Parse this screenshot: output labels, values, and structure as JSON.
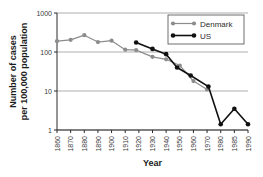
{
  "chart_data": {
    "type": "line",
    "title": "",
    "xlabel": "Year",
    "ylabel_line1": "Number of cases",
    "ylabel_line2": "per 100,000 population",
    "yscale": "log",
    "ylim": [
      1,
      1000
    ],
    "ytick_labels": [
      "1000",
      "100",
      "10",
      "1"
    ],
    "ytick_values": [
      1000,
      100,
      10,
      1
    ],
    "grid": true,
    "grid_axis": "y",
    "xlim": [
      1858,
      1993
    ],
    "xtick_labels": [
      "1860",
      "1870",
      "1880",
      "1890",
      "1900",
      "1910",
      "1920",
      "1930",
      "1940",
      "1950",
      "1960",
      "1970",
      "1980",
      "1985",
      "1990"
    ],
    "xtick_values": [
      1860,
      1870,
      1880,
      1890,
      1900,
      1910,
      1920,
      1930,
      1940,
      1950,
      1960,
      1970,
      1980,
      1985,
      1990
    ],
    "legend_position": "top-right",
    "series": [
      {
        "name": "Denmark",
        "color": "#8c8c8c",
        "marker": "circle",
        "x": [
          1860,
          1870,
          1880,
          1890,
          1900,
          1910,
          1918,
          1930,
          1940,
          1950,
          1960,
          1970
        ],
        "values": [
          190,
          205,
          270,
          180,
          195,
          115,
          112,
          75,
          65,
          45,
          18,
          11
        ]
      },
      {
        "name": "US",
        "color": "#111111",
        "marker": "circle",
        "x": [
          1918,
          1930,
          1940,
          1948,
          1958,
          1971,
          1980,
          1985,
          1990
        ],
        "values": [
          175,
          120,
          88,
          40,
          25,
          13,
          1.4,
          3.5,
          1.4
        ]
      }
    ]
  },
  "legend": {
    "entries": [
      {
        "label": "Denmark"
      },
      {
        "label": "US"
      }
    ]
  }
}
